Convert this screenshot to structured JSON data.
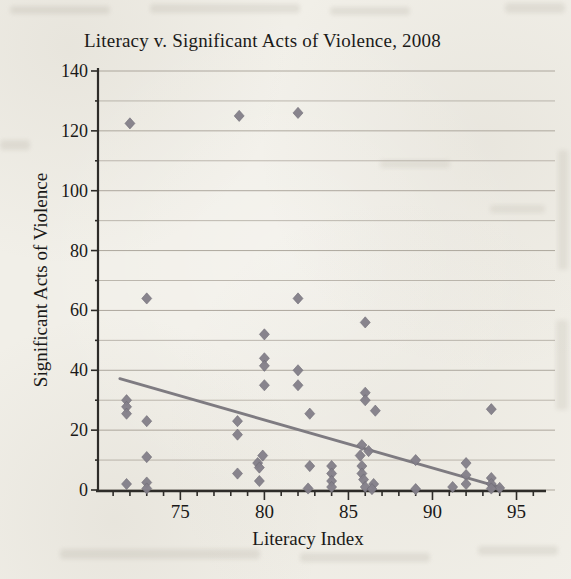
{
  "page": {
    "kind": "scanned textbook page with a single scatter chart",
    "paper_color": "#f1efe8"
  },
  "chart_data": {
    "type": "scatter",
    "title": "Literacy v. Significant Acts of Violence, 2008",
    "xlabel": "Literacy Index",
    "ylabel": "Significant Acts of Violence",
    "xlim": [
      70.1,
      96.1
    ],
    "ylim": [
      0,
      140
    ],
    "x_tick_labels": [
      75,
      80,
      85,
      90,
      95
    ],
    "x_minor_tick_step": 1,
    "x_minor_tick_start": 71,
    "x_minor_tick_end": 96,
    "y_tick_labels": [
      0,
      20,
      40,
      60,
      80,
      100,
      120,
      140
    ],
    "y_grid_step": 10,
    "grid": "horizontal-only",
    "legend": "none",
    "marker": "diamond",
    "colors": {
      "marker": "#84808a",
      "marker_edge": "#6c6872",
      "trendline": "#7e7b81",
      "grid": "#a29b91",
      "axis": "#2e2c29",
      "text": "#1a1918"
    },
    "trendline": {
      "x1": 71.4,
      "y1": 37.2,
      "x2": 94.1,
      "y2": 0.8
    },
    "points": [
      [
        72,
        122.5
      ],
      [
        78.5,
        125
      ],
      [
        82,
        126
      ],
      [
        73,
        64
      ],
      [
        82,
        64
      ],
      [
        86,
        56
      ],
      [
        80,
        52
      ],
      [
        80,
        44
      ],
      [
        80,
        41.5
      ],
      [
        82,
        40
      ],
      [
        82,
        35
      ],
      [
        80,
        35
      ],
      [
        86,
        32.5
      ],
      [
        86,
        30
      ],
      [
        71.8,
        30
      ],
      [
        71.8,
        27.8
      ],
      [
        71.8,
        25.5
      ],
      [
        93.5,
        27
      ],
      [
        86.6,
        26.5
      ],
      [
        82.7,
        25.5
      ],
      [
        73,
        23
      ],
      [
        78.4,
        23
      ],
      [
        78.4,
        18.5
      ],
      [
        85.8,
        15
      ],
      [
        86.2,
        13
      ],
      [
        73,
        11
      ],
      [
        85.7,
        11.5
      ],
      [
        79.9,
        11.5
      ],
      [
        89,
        10
      ],
      [
        92,
        9
      ],
      [
        79.6,
        9
      ],
      [
        84,
        8
      ],
      [
        85.8,
        8
      ],
      [
        82.7,
        8
      ],
      [
        79.7,
        7.5
      ],
      [
        84,
        5.5
      ],
      [
        85.8,
        5.5
      ],
      [
        78.4,
        5.5
      ],
      [
        92,
        5
      ],
      [
        93.5,
        4
      ],
      [
        85.9,
        3.5
      ],
      [
        79.7,
        3
      ],
      [
        84,
        3
      ],
      [
        73,
        2.5
      ],
      [
        86.5,
        2
      ],
      [
        92,
        2
      ],
      [
        93.5,
        2
      ],
      [
        71.8,
        2
      ],
      [
        84,
        1
      ],
      [
        86,
        1
      ],
      [
        91.2,
        1
      ],
      [
        94,
        0.7
      ],
      [
        93.5,
        0.5
      ],
      [
        86.4,
        0.3
      ],
      [
        89,
        0.3
      ],
      [
        82.6,
        0.5
      ],
      [
        73,
        0.5
      ]
    ]
  }
}
